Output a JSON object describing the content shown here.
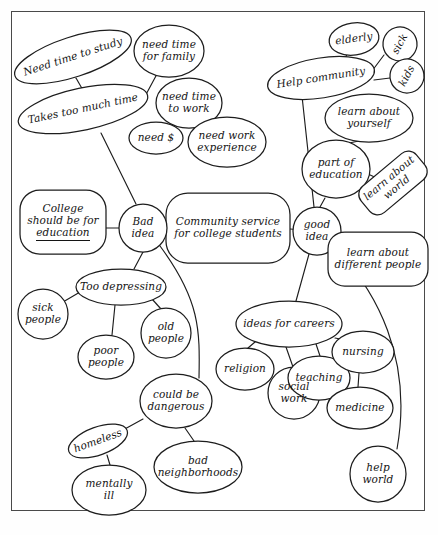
{
  "document": {
    "type": "hand-drawn concept map / brainstorming web",
    "medium": "ink on white paper",
    "center_topic": "Community service for college students"
  },
  "chart_data": {
    "type": "diagram",
    "title": "Community service for college students",
    "layout": "radial concept map with two main branches: Bad idea (left) and good idea (right)",
    "nodes": [
      {
        "id": "center",
        "label": "Community service\nfor college students",
        "x": 228,
        "y": 228,
        "rx": 62,
        "ry": 35,
        "shape": "roundrect",
        "rot": 0,
        "fs": 10.5
      },
      {
        "id": "bad_idea",
        "label": "Bad\nidea",
        "x": 143,
        "y": 228,
        "rx": 24,
        "ry": 24,
        "shape": "ellipse",
        "rot": 0,
        "fs": 10.5
      },
      {
        "id": "good_idea",
        "label": "good\nidea",
        "x": 317,
        "y": 231,
        "rx": 24,
        "ry": 24,
        "shape": "ellipse",
        "rot": 0,
        "fs": 10.5
      },
      {
        "id": "college_education",
        "label": "College\nshould be for\neducation",
        "x": 63,
        "y": 222,
        "rx": 43,
        "ry": 32,
        "shape": "roundrect",
        "rot": 0,
        "fs": 10.5,
        "underline_last": true
      },
      {
        "id": "takes_too_much",
        "label": "Takes too much time",
        "x": 83,
        "y": 109,
        "rx": 66,
        "ry": 21,
        "shape": "ellipse",
        "rot": -12,
        "fs": 10.5
      },
      {
        "id": "need_study",
        "label": "Need time to study",
        "x": 73,
        "y": 57,
        "rx": 61,
        "ry": 20,
        "shape": "ellipse",
        "rot": -18,
        "fs": 10.5
      },
      {
        "id": "need_family",
        "label": "need time\nfor family",
        "x": 169,
        "y": 51,
        "rx": 35,
        "ry": 26,
        "shape": "ellipse",
        "rot": 0,
        "fs": 10.5
      },
      {
        "id": "need_work",
        "label": "need time\nto work",
        "x": 189,
        "y": 103,
        "rx": 33,
        "ry": 25,
        "shape": "ellipse",
        "rot": 0,
        "fs": 10.5
      },
      {
        "id": "need_money",
        "label": "need $",
        "x": 156,
        "y": 138,
        "rx": 27,
        "ry": 16,
        "shape": "ellipse",
        "rot": 0,
        "fs": 10.5
      },
      {
        "id": "need_experience",
        "label": "need work\nexperience",
        "x": 227,
        "y": 142,
        "rx": 39,
        "ry": 25,
        "shape": "ellipse",
        "rot": 0,
        "fs": 10.5
      },
      {
        "id": "too_depressing",
        "label": "Too depressing",
        "x": 121,
        "y": 287,
        "rx": 45,
        "ry": 18,
        "shape": "ellipse",
        "rot": 0,
        "fs": 10.5
      },
      {
        "id": "sick_people",
        "label": "sick\npeople",
        "x": 43,
        "y": 314,
        "rx": 25,
        "ry": 25,
        "shape": "ellipse",
        "rot": 0,
        "fs": 10.5
      },
      {
        "id": "poor_people",
        "label": "poor\npeople",
        "x": 106,
        "y": 357,
        "rx": 28,
        "ry": 22,
        "shape": "ellipse",
        "rot": 0,
        "fs": 10.5
      },
      {
        "id": "old_people",
        "label": "old\npeople",
        "x": 166,
        "y": 333,
        "rx": 25,
        "ry": 25,
        "shape": "ellipse",
        "rot": 0,
        "fs": 10.5
      },
      {
        "id": "could_dangerous",
        "label": "could be\ndangerous",
        "x": 176,
        "y": 401,
        "rx": 36,
        "ry": 27,
        "shape": "ellipse",
        "rot": 0,
        "fs": 10.5
      },
      {
        "id": "homeless",
        "label": "homeless",
        "x": 98,
        "y": 441,
        "rx": 31,
        "ry": 14,
        "shape": "ellipse",
        "rot": -20,
        "fs": 10.5
      },
      {
        "id": "mentally_ill",
        "label": "mentally\nill",
        "x": 109,
        "y": 490,
        "rx": 37,
        "ry": 25,
        "shape": "ellipse",
        "rot": 0,
        "fs": 10.5
      },
      {
        "id": "bad_neighborhoods",
        "label": "bad\nneighborhoods",
        "x": 198,
        "y": 467,
        "rx": 44,
        "ry": 26,
        "shape": "ellipse",
        "rot": 0,
        "fs": 10.5
      },
      {
        "id": "help_community",
        "label": "Help community",
        "x": 321,
        "y": 78,
        "rx": 54,
        "ry": 20,
        "shape": "ellipse",
        "rot": -9,
        "fs": 10.5
      },
      {
        "id": "elderly",
        "label": "elderly",
        "x": 354,
        "y": 39,
        "rx": 25,
        "ry": 16,
        "shape": "ellipse",
        "rot": -8,
        "fs": 10.5
      },
      {
        "id": "sick",
        "label": "sick",
        "x": 400,
        "y": 44,
        "rx": 17,
        "ry": 17,
        "shape": "ellipse",
        "rot": -62,
        "fs": 10.5
      },
      {
        "id": "kids",
        "label": "kids",
        "x": 407,
        "y": 76,
        "rx": 17,
        "ry": 17,
        "shape": "ellipse",
        "rot": -62,
        "fs": 10.5
      },
      {
        "id": "learn_yourself",
        "label": "learn about\nyourself",
        "x": 369,
        "y": 118,
        "rx": 44,
        "ry": 24,
        "shape": "ellipse",
        "rot": 0,
        "fs": 10.5
      },
      {
        "id": "part_education",
        "label": "part of\neducation",
        "x": 336,
        "y": 169,
        "rx": 34,
        "ry": 29,
        "shape": "ellipse",
        "rot": 0,
        "fs": 10.5
      },
      {
        "id": "learn_world",
        "label": "learn about\nworld",
        "x": 393,
        "y": 183,
        "rx": 36,
        "ry": 17,
        "shape": "roundrect",
        "rot": -40,
        "fs": 10.5
      },
      {
        "id": "learn_different",
        "label": "learn about\ndifferent people",
        "x": 378,
        "y": 259,
        "rx": 50,
        "ry": 27,
        "shape": "roundrect",
        "rot": 0,
        "fs": 10.5
      },
      {
        "id": "ideas_careers",
        "label": "ideas for careers",
        "x": 289,
        "y": 324,
        "rx": 53,
        "ry": 23,
        "shape": "ellipse",
        "rot": 0,
        "fs": 10.5
      },
      {
        "id": "religion",
        "label": "religion",
        "x": 245,
        "y": 369,
        "rx": 29,
        "ry": 21,
        "shape": "ellipse",
        "rot": 0,
        "fs": 10.5
      },
      {
        "id": "social_work",
        "label": "social\nwork",
        "x": 294,
        "y": 393,
        "rx": 26,
        "ry": 26,
        "shape": "ellipse",
        "rot": 0,
        "fs": 10.5
      },
      {
        "id": "teaching",
        "label": "teaching",
        "x": 319,
        "y": 378,
        "rx": 31,
        "ry": 22,
        "shape": "ellipse",
        "rot": 0,
        "fs": 10.5
      },
      {
        "id": "nursing",
        "label": "nursing",
        "x": 363,
        "y": 352,
        "rx": 31,
        "ry": 21,
        "shape": "ellipse",
        "rot": 0,
        "fs": 10.5
      },
      {
        "id": "medicine",
        "label": "medicine",
        "x": 360,
        "y": 408,
        "rx": 33,
        "ry": 21,
        "shape": "ellipse",
        "rot": 0,
        "fs": 10.5
      },
      {
        "id": "help_world",
        "label": "help\nworld",
        "x": 378,
        "y": 474,
        "rx": 28,
        "ry": 28,
        "shape": "ellipse",
        "rot": 0,
        "fs": 10.5
      }
    ],
    "edges": [
      {
        "from": "college_education",
        "to": "bad_idea",
        "path": "M 106 228 L 119 228"
      },
      {
        "from": "bad_idea",
        "to": "center",
        "path": "M 167 228 L 180 228"
      },
      {
        "from": "center",
        "to": "good_idea",
        "path": "M 290 229 L 303 230"
      },
      {
        "from": "takes_too_much",
        "to": "bad_idea",
        "path": "M 101 133 L 136 204"
      },
      {
        "from": "takes_too_much",
        "to": "need_study",
        "path": "M 76 78 L 84 92"
      },
      {
        "from": "takes_too_much",
        "to": "need_family",
        "path": "M 143 100 L 157 74"
      },
      {
        "from": "need_work",
        "to": "need_money",
        "path": "M 173 125 L 163 124"
      },
      {
        "from": "need_work",
        "to": "need_experience",
        "path": "M 199 127 L 210 122"
      },
      {
        "from": "bad_idea",
        "to": "too_depressing",
        "path": "M 143 252 L 134 269"
      },
      {
        "from": "too_depressing",
        "to": "sick_people",
        "path": "M 80 292 L 63 302"
      },
      {
        "from": "too_depressing",
        "to": "poor_people",
        "path": "M 115 305 L 112 335"
      },
      {
        "from": "too_depressing",
        "to": "old_people",
        "path": "M 152 299 L 161 309"
      },
      {
        "from": "bad_idea",
        "to": "could_dangerous",
        "path": "M 160 246 C 200 300 200 330 199 378"
      },
      {
        "from": "could_dangerous",
        "to": "homeless",
        "path": "M 143 419 L 123 430"
      },
      {
        "from": "homeless",
        "to": "mentally_ill",
        "path": "M 107 455 L 110 465"
      },
      {
        "from": "could_dangerous",
        "to": "bad_neighborhoods",
        "path": "M 185 428 L 194 441"
      },
      {
        "from": "help_community",
        "to": "elderly",
        "path": "M 345 59 L 347 54"
      },
      {
        "from": "help_community",
        "to": "sick",
        "path": "M 372 71 L 384 55"
      },
      {
        "from": "help_community",
        "to": "kids",
        "path": "M 374 80 L 390 78"
      },
      {
        "from": "help_community",
        "to": "good_idea",
        "path": "M 302 96 L 314 207"
      },
      {
        "from": "part_education",
        "to": "learn_yourself",
        "path": "M 349 143 L 359 141"
      },
      {
        "from": "part_education",
        "to": "learn_world",
        "path": "M 368 174 L 381 180"
      },
      {
        "from": "part_education",
        "to": "good_idea",
        "path": "M 325 198 L 320 207"
      },
      {
        "from": "good_idea",
        "to": "learn_different",
        "path": "M 333 245 L 348 249"
      },
      {
        "from": "good_idea",
        "to": "ideas_careers",
        "path": "M 309 254 L 296 301"
      },
      {
        "from": "ideas_careers",
        "to": "religion",
        "path": "M 255 342 L 248 348"
      },
      {
        "from": "ideas_careers",
        "to": "social_work",
        "path": "M 286 347 L 293 367"
      },
      {
        "from": "ideas_careers",
        "to": "teaching",
        "path": "M 316 344 L 320 356"
      },
      {
        "from": "ideas_careers",
        "to": "nursing",
        "path": "M 335 338 L 345 340"
      },
      {
        "from": "nursing",
        "to": "medicine",
        "path": "M 359 373 L 358 387"
      },
      {
        "from": "good_idea",
        "to": "help_world",
        "path": "M 330 243 C 378 290 413 360 397 449"
      }
    ]
  }
}
